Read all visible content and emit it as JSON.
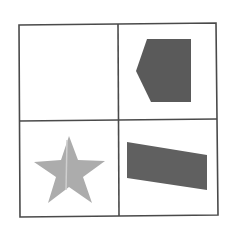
{
  "canvas": {
    "width": 238,
    "height": 233,
    "background": "#ffffff"
  },
  "grid": {
    "line_color": "#4a4a4a",
    "line_width": 1.6,
    "outer": [
      [
        19,
        25
      ],
      [
        216,
        23
      ],
      [
        218,
        215
      ],
      [
        20,
        217
      ]
    ],
    "vertical_divider": [
      [
        118,
        24
      ],
      [
        119,
        216
      ]
    ],
    "horizontal_divider": [
      [
        19,
        121
      ],
      [
        217,
        119
      ]
    ],
    "rows": 2,
    "cols": 2
  },
  "cells": [
    {
      "position": "top-left",
      "content": "empty"
    },
    {
      "position": "top-right",
      "content": "shape",
      "shape": {
        "name": "pentagon-arrow",
        "fill": "#5a5a5a",
        "points": [
          [
            147,
            39
          ],
          [
            191,
            39
          ],
          [
            191,
            102
          ],
          [
            151,
            102
          ],
          [
            136,
            71
          ]
        ]
      }
    },
    {
      "position": "bottom-left",
      "content": "shape",
      "shape": {
        "name": "star",
        "fill": "#acacac",
        "fold_line_color": "#cfcfcf",
        "points": [
          [
            69,
            136
          ],
          [
            78,
            160
          ],
          [
            105,
            161
          ],
          [
            83,
            177
          ],
          [
            92,
            203
          ],
          [
            69,
            187
          ],
          [
            48,
            203
          ],
          [
            56,
            177
          ],
          [
            34,
            162
          ],
          [
            61,
            160
          ]
        ],
        "fold_line": [
          [
            67,
            140
          ],
          [
            66,
            190
          ]
        ]
      }
    },
    {
      "position": "bottom-right",
      "content": "shape",
      "shape": {
        "name": "slanted-quadrilateral",
        "fill": "#606060",
        "points": [
          [
            127,
            142
          ],
          [
            207,
            155
          ],
          [
            207,
            190
          ],
          [
            127,
            178
          ]
        ]
      }
    }
  ]
}
